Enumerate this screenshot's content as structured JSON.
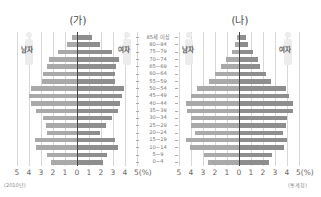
{
  "chart_data": [
    {
      "type": "bar",
      "title": "(가)",
      "orientation": "horizontal population pyramid",
      "categories": [
        "85세 이상",
        "80~84",
        "75~79",
        "70~74",
        "65~69",
        "60~64",
        "55~59",
        "50~54",
        "45~49",
        "40~44",
        "35~39",
        "30~34",
        "25~29",
        "20~24",
        "15~19",
        "10~14",
        "5~9",
        "0~4"
      ],
      "series": [
        {
          "name": "남자",
          "values": [
            0.4,
            0.8,
            1.6,
            2.3,
            2.5,
            2.8,
            2.9,
            3.8,
            4.0,
            3.8,
            3.4,
            2.8,
            2.6,
            2.5,
            3.5,
            3.4,
            2.5,
            2.2
          ]
        },
        {
          "name": "여자",
          "values": [
            1.2,
            1.8,
            2.8,
            3.4,
            3.2,
            3.1,
            3.1,
            3.8,
            3.7,
            3.5,
            3.3,
            2.8,
            2.3,
            1.8,
            3.1,
            3.3,
            2.4,
            2.1
          ]
        }
      ],
      "xlabel": "(%)",
      "xticks": [
        "5",
        "4",
        "3",
        "2",
        "1",
        "0",
        "1",
        "2",
        "3",
        "4",
        "5(%)"
      ],
      "xlim": [
        -5,
        5
      ],
      "source_note": "(2010년)",
      "grid": true
    },
    {
      "type": "bar",
      "title": "(나)",
      "orientation": "horizontal population pyramid",
      "categories": [
        "85세 이상",
        "80~84",
        "75~79",
        "70~74",
        "65~69",
        "60~64",
        "55~59",
        "50~54",
        "45~49",
        "40~44",
        "35~39",
        "30~34",
        "25~29",
        "20~24",
        "15~19",
        "10~14",
        "5~9",
        "0~4"
      ],
      "series": [
        {
          "name": "남자",
          "values": [
            0.2,
            0.3,
            0.6,
            1.1,
            1.5,
            2.0,
            2.5,
            3.5,
            4.0,
            4.4,
            4.3,
            4.0,
            4.0,
            3.7,
            4.4,
            4.1,
            2.9,
            2.6
          ]
        },
        {
          "name": "여자",
          "values": [
            0.5,
            0.7,
            1.1,
            1.5,
            1.7,
            2.2,
            2.6,
            3.8,
            4.1,
            4.4,
            4.4,
            3.9,
            3.8,
            3.6,
            3.9,
            3.7,
            2.7,
            2.4
          ]
        }
      ],
      "xlabel": "(%)",
      "xticks": [
        "5",
        "4",
        "3",
        "2",
        "1",
        "0",
        "1",
        "2",
        "3",
        "4",
        "5(%)"
      ],
      "xlim": [
        -5,
        5
      ],
      "source_note": "(통계청)",
      "grid": true
    }
  ],
  "labels": {
    "left_title": "(가)",
    "right_title": "(나)",
    "male": "남자",
    "female": "여자",
    "left_note": "(2010년)",
    "right_note": "(통계청)",
    "unit": "5(%)",
    "ticks": [
      "5",
      "4",
      "3",
      "2",
      "1",
      "0",
      "1",
      "2",
      "3",
      "4"
    ]
  }
}
